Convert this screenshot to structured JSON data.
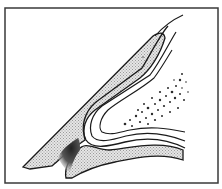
{
  "figure": {
    "colors": {
      "background": "#ffffff",
      "line": "#1a1a1a",
      "hatch_fill": "#c8c8c8",
      "frame": "#3a3a3a"
    },
    "regions": [
      {
        "id": "outer-wall",
        "fill": "hatched"
      },
      {
        "id": "lower-base",
        "fill": "hatched"
      },
      {
        "id": "lamellar-fold",
        "fill": "none"
      },
      {
        "id": "speckled-core",
        "fill": "dots"
      },
      {
        "id": "dark-lesion",
        "fill": "stipple"
      }
    ]
  }
}
